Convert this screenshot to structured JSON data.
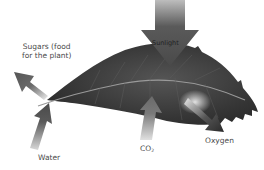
{
  "diagram": {
    "colors": {
      "leaf": "#3a3a3a",
      "leaf_vein": "#9a9a9a",
      "arrow_dark": "#4a4a4a",
      "arrow_mid": "#6e6e6e",
      "label_text": "#4a4a4a",
      "background": "#ffffff"
    },
    "labels": {
      "sugars_line1": "Sugars (food",
      "sugars_line2": "for the plant)",
      "sunlight": "Sunlight",
      "water": "Water",
      "co2_main": "CO",
      "co2_sub": "2",
      "oxygen": "Oxygen"
    },
    "arrows": [
      {
        "name": "sunlight",
        "direction": "down",
        "flow": "in"
      },
      {
        "name": "water",
        "direction": "up",
        "flow": "in"
      },
      {
        "name": "co2",
        "direction": "up",
        "flow": "in"
      },
      {
        "name": "sugars",
        "direction": "up-left",
        "flow": "out"
      },
      {
        "name": "oxygen",
        "direction": "down-right",
        "flow": "out"
      }
    ]
  }
}
